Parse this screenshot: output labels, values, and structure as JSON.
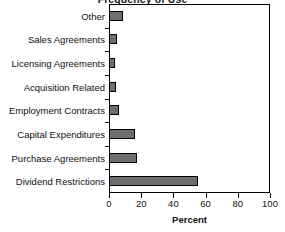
{
  "chart_data": {
    "type": "bar",
    "orientation": "horizontal",
    "title": "Frequency of Use",
    "xlabel": "Percent",
    "ylabel": "",
    "xlim": [
      0,
      100
    ],
    "xticks": [
      0,
      20,
      40,
      60,
      80,
      100
    ],
    "xticklabels": [
      "0",
      "20",
      "40",
      "60",
      "80",
      "100"
    ],
    "grid": false,
    "legend": false,
    "bar_color": "#6e6e6e",
    "bar_edge_color": "#000000",
    "frame_color": "#000000",
    "categories": [
      "Other",
      "Sales Agreements",
      "Licensing Agreements",
      "Acquisition Related",
      "Employment Contracts",
      "Capital Expenditures",
      "Purchase Agreements",
      "Dividend Restrictions"
    ],
    "values": [
      9,
      5,
      4,
      4.5,
      6,
      16,
      17.5,
      55
    ]
  }
}
